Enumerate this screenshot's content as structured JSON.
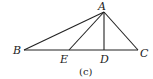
{
  "figure": {
    "caption": "(c)",
    "points": {
      "A": {
        "label": "A",
        "x": 104,
        "y": 12
      },
      "B": {
        "label": "B",
        "x": 24,
        "y": 50
      },
      "C": {
        "label": "C",
        "x": 138,
        "y": 50
      },
      "D": {
        "label": "D",
        "x": 104,
        "y": 50
      },
      "E": {
        "label": "E",
        "x": 69,
        "y": 50
      }
    },
    "segments": [
      "AB",
      "AC",
      "AD",
      "AE",
      "BC"
    ],
    "colors": {
      "stroke": "#222222",
      "background": "#ffffff"
    }
  }
}
